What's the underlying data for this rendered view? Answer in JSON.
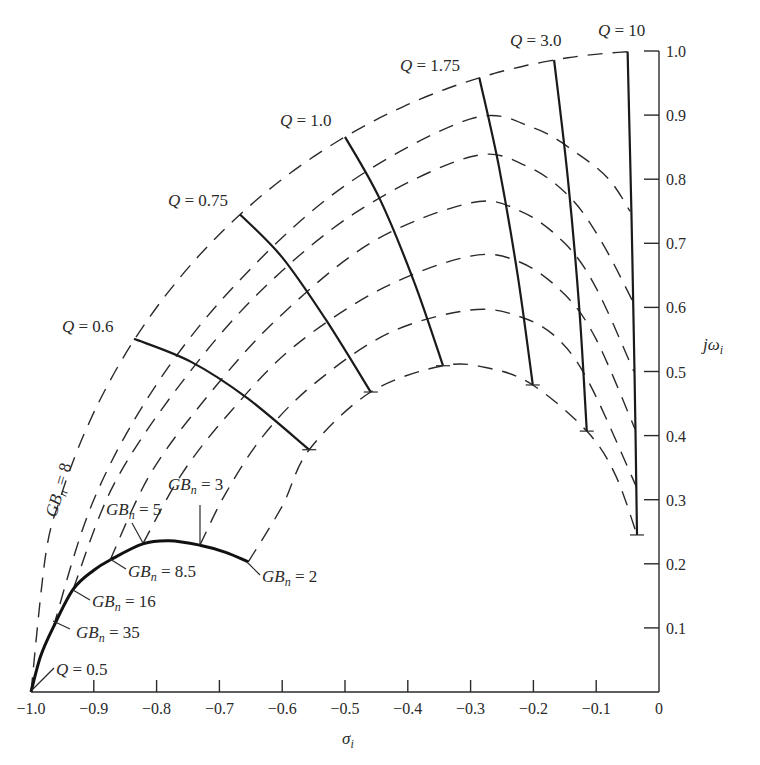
{
  "chart_data": {
    "type": "line",
    "title": "",
    "xlabel": "σ_i",
    "ylabel": "jω_i",
    "xlim": [
      -1.0,
      0
    ],
    "ylim": [
      0,
      1.0
    ],
    "grid": false,
    "legend": "none (inline curve labels)",
    "x_ticks": [
      "-1.0",
      "-0.9",
      "-0.8",
      "-0.7",
      "-0.6",
      "-0.5",
      "-0.4",
      "-0.3",
      "-0.2",
      "-0.1",
      "0"
    ],
    "x_tick_values": [
      -1.0,
      -0.9,
      -0.8,
      -0.7,
      -0.6,
      -0.5,
      -0.4,
      -0.3,
      -0.2,
      -0.1,
      0
    ],
    "y_ticks": [
      "0.1",
      "0.2",
      "0.3",
      "0.4",
      "0.5",
      "0.6",
      "0.7",
      "0.8",
      "0.9",
      "1.0"
    ],
    "y_tick_values": [
      0.1,
      0.2,
      0.3,
      0.4,
      0.5,
      0.6,
      0.7,
      0.8,
      0.9,
      1.0
    ],
    "q_curves": [
      {
        "name": "Q = 0.6",
        "label": "Q = 0.6",
        "points": [
          [
            -0.836,
            0.551
          ],
          [
            -0.745,
            0.515
          ],
          [
            -0.655,
            0.458
          ],
          [
            -0.557,
            0.378
          ]
        ]
      },
      {
        "name": "Q = 0.75",
        "label": "Q = 0.75",
        "points": [
          [
            -0.667,
            0.745
          ],
          [
            -0.6,
            0.678
          ],
          [
            -0.53,
            0.58
          ],
          [
            -0.459,
            0.468
          ]
        ]
      },
      {
        "name": "Q = 1.0",
        "label": "Q = 1.0",
        "points": [
          [
            -0.5,
            0.866
          ],
          [
            -0.445,
            0.77
          ],
          [
            -0.39,
            0.64
          ],
          [
            -0.344,
            0.509
          ]
        ]
      },
      {
        "name": "Q = 1.75",
        "label": "Q = 1.75",
        "points": [
          [
            -0.286,
            0.958
          ],
          [
            -0.255,
            0.82
          ],
          [
            -0.225,
            0.65
          ],
          [
            -0.201,
            0.479
          ]
        ]
      },
      {
        "name": "Q = 3.0",
        "label": "Q = 3.0",
        "points": [
          [
            -0.167,
            0.986
          ],
          [
            -0.145,
            0.8
          ],
          [
            -0.127,
            0.6
          ],
          [
            -0.115,
            0.407
          ]
        ]
      },
      {
        "name": "Q = 10",
        "label": "Q = 10",
        "points": [
          [
            -0.05,
            0.999
          ],
          [
            -0.044,
            0.75
          ],
          [
            -0.039,
            0.5
          ],
          [
            -0.035,
            0.245
          ]
        ]
      }
    ],
    "q_half_curve": {
      "name": "Q = 0.5",
      "label": "Q = 0.5",
      "points": [
        [
          -1.0,
          0.0
        ],
        [
          -0.985,
          0.055
        ],
        [
          -0.965,
          0.1
        ],
        [
          -0.933,
          0.16
        ],
        [
          -0.9,
          0.19
        ],
        [
          -0.874,
          0.206
        ],
        [
          -0.822,
          0.231
        ],
        [
          -0.78,
          0.236
        ],
        [
          -0.731,
          0.229
        ],
        [
          -0.69,
          0.218
        ],
        [
          -0.654,
          0.203
        ]
      ]
    },
    "gb_curves": [
      {
        "name": "GBn = ∞",
        "label": "GBn = ∞",
        "points": "unit-circle",
        "range": [
          -1.0,
          -0.05
        ]
      },
      {
        "name": "GBn = 35",
        "points": [
          [
            -0.965,
            0.1
          ],
          [
            -0.9,
            0.3
          ],
          [
            -0.8,
            0.48
          ],
          [
            -0.67,
            0.64
          ],
          [
            -0.5,
            0.79
          ],
          [
            -0.3,
            0.894
          ],
          [
            -0.2,
            0.88
          ],
          [
            -0.13,
            0.84
          ],
          [
            -0.08,
            0.8
          ],
          [
            -0.046,
            0.75
          ]
        ]
      },
      {
        "name": "GBn = 16",
        "points": [
          [
            -0.933,
            0.16
          ],
          [
            -0.87,
            0.32
          ],
          [
            -0.77,
            0.47
          ],
          [
            -0.64,
            0.62
          ],
          [
            -0.48,
            0.75
          ],
          [
            -0.3,
            0.835
          ],
          [
            -0.21,
            0.82
          ],
          [
            -0.14,
            0.77
          ],
          [
            -0.09,
            0.7
          ],
          [
            -0.042,
            0.61
          ]
        ]
      },
      {
        "name": "GBn = 8.5",
        "points": [
          [
            -0.874,
            0.206
          ],
          [
            -0.81,
            0.34
          ],
          [
            -0.72,
            0.46
          ],
          [
            -0.61,
            0.58
          ],
          [
            -0.46,
            0.7
          ],
          [
            -0.3,
            0.763
          ],
          [
            -0.22,
            0.75
          ],
          [
            -0.15,
            0.7
          ],
          [
            -0.1,
            0.63
          ],
          [
            -0.04,
            0.5
          ]
        ]
      },
      {
        "name": "GBn = 5",
        "points": [
          [
            -0.822,
            0.231
          ],
          [
            -0.76,
            0.34
          ],
          [
            -0.68,
            0.44
          ],
          [
            -0.58,
            0.54
          ],
          [
            -0.44,
            0.63
          ],
          [
            -0.3,
            0.68
          ],
          [
            -0.22,
            0.67
          ],
          [
            -0.15,
            0.62
          ],
          [
            -0.1,
            0.55
          ],
          [
            -0.038,
            0.41
          ]
        ]
      },
      {
        "name": "GBn = 3",
        "points": [
          [
            -0.731,
            0.229
          ],
          [
            -0.69,
            0.31
          ],
          [
            -0.63,
            0.4
          ],
          [
            -0.55,
            0.48
          ],
          [
            -0.43,
            0.56
          ],
          [
            -0.3,
            0.596
          ],
          [
            -0.22,
            0.585
          ],
          [
            -0.16,
            0.55
          ],
          [
            -0.11,
            0.48
          ],
          [
            -0.036,
            0.32
          ]
        ]
      },
      {
        "name": "GBn = 2",
        "points": [
          [
            -0.654,
            0.203
          ],
          [
            -0.6,
            0.29
          ],
          [
            -0.557,
            0.378
          ],
          [
            -0.459,
            0.468
          ],
          [
            -0.344,
            0.509
          ],
          [
            -0.27,
            0.505
          ],
          [
            -0.201,
            0.479
          ],
          [
            -0.115,
            0.407
          ],
          [
            -0.07,
            0.34
          ],
          [
            -0.035,
            0.245
          ]
        ]
      }
    ],
    "annotations": [
      {
        "text": "Q = 0.6",
        "at": [
          -0.94,
          0.57
        ]
      },
      {
        "text": "Q = 0.75",
        "at": [
          -0.8,
          0.765
        ]
      },
      {
        "text": "Q = 1.0",
        "at": [
          -0.59,
          0.89
        ]
      },
      {
        "text": "Q = 1.75",
        "at": [
          -0.4,
          0.98
        ]
      },
      {
        "text": "Q = 3.0",
        "at": [
          -0.24,
          1.03
        ]
      },
      {
        "text": "Q = 10",
        "at": [
          -0.09,
          1.05
        ]
      },
      {
        "text": "Q = 0.5",
        "at": [
          -0.94,
          0.03
        ]
      },
      {
        "text": "GBn = ∞",
        "at": [
          -0.97,
          0.33
        ],
        "rotated": true
      },
      {
        "text": "GBn = 3",
        "at": [
          -0.77,
          0.34
        ]
      },
      {
        "text": "GBn = 5",
        "at": [
          -0.87,
          0.285
        ]
      },
      {
        "text": "GBn = 8.5",
        "at": [
          -0.85,
          0.19
        ]
      },
      {
        "text": "GBn = 16",
        "at": [
          -0.91,
          0.13
        ]
      },
      {
        "text": "GBn = 35",
        "at": [
          -0.93,
          0.07
        ]
      },
      {
        "text": "GBn = 2",
        "at": [
          -0.63,
          0.19
        ]
      }
    ]
  },
  "labels": {
    "x_axis": "σ",
    "x_axis_sub": "i",
    "y_axis": "jω",
    "y_axis_sub": "i",
    "gb_prefix": "GB",
    "gb_sub": "n",
    "q_letter": "Q"
  }
}
